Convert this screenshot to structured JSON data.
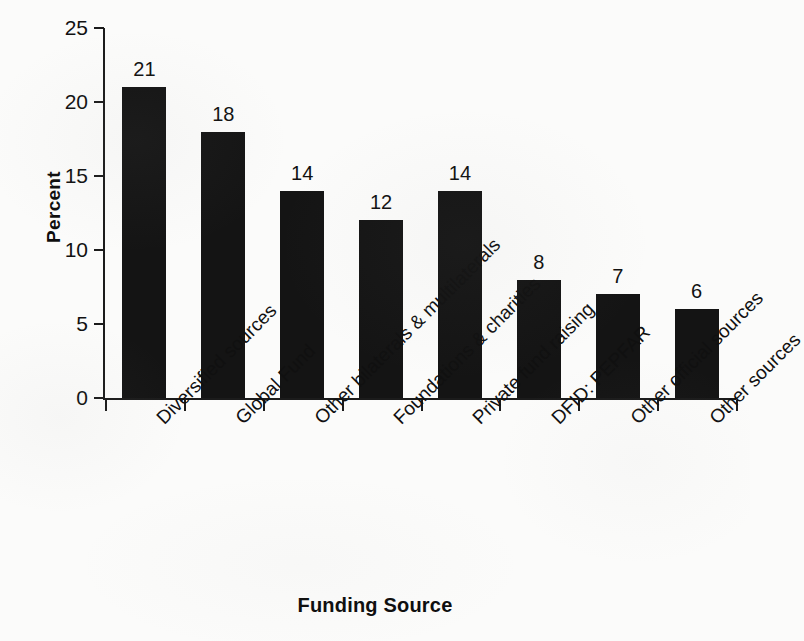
{
  "chart_data": {
    "type": "bar",
    "title": "",
    "subtitle": "",
    "xlabel": "Funding Source",
    "ylabel": "Percent",
    "categories": [
      "Diversified  sources",
      "Global Fund",
      "Other bilaterals & multilaterals",
      "Foundations & charities",
      "Private fund raising",
      "DFID: PEPFAR",
      "Other official sources",
      "Other sources"
    ],
    "values": [
      21,
      18,
      14,
      12,
      14,
      8,
      7,
      6
    ],
    "value_labels": [
      "21",
      "18",
      "14",
      "12",
      "14",
      "8",
      "7",
      "6"
    ],
    "ylim": [
      0,
      25
    ],
    "ytick_values": [
      0,
      5,
      10,
      15,
      20,
      25
    ],
    "ytick_labels": [
      "0",
      "5",
      "10",
      "15",
      "20",
      "25"
    ],
    "grid": false,
    "legend": false,
    "legend_position": "none",
    "bar_color": "#141414",
    "axis_color": "#1b1b1b",
    "background_color": "#fbfbfa",
    "label_rotation_degrees": -45,
    "series": [
      {
        "name": "Percent",
        "values": [
          21,
          18,
          14,
          12,
          14,
          8,
          7,
          6
        ]
      }
    ]
  }
}
